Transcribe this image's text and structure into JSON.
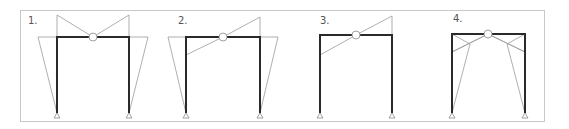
{
  "figure": {
    "colors": {
      "frame": "#2a2a2a",
      "diagram": "#9a9a9a",
      "border": "#c8c8c8"
    },
    "panels": [
      {
        "label": "1.",
        "case": "symmetric-full",
        "left_x": 57,
        "right_x": 129,
        "hinge_x": 93
      },
      {
        "label": "2.",
        "case": "antisymmetric-beam",
        "left_x": 186,
        "right_x": 260,
        "hinge_x": 223
      },
      {
        "label": "3.",
        "case": "beam-only",
        "left_x": 320,
        "right_x": 392,
        "hinge_x": 356
      },
      {
        "label": "4.",
        "case": "combined-crosshatched",
        "left_x": 452,
        "right_x": 525,
        "hinge_x": 488
      }
    ]
  }
}
